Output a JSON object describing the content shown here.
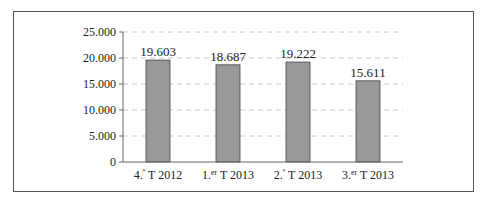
{
  "chart_data": {
    "type": "bar",
    "title": "",
    "xlabel": "",
    "ylabel": "",
    "categories": [
      "4.º T 2012",
      "1.er T 2013",
      "2.º T 2013",
      "3.er T 2013"
    ],
    "category_parts": [
      {
        "num": "4.",
        "sup": "º",
        "rest": " T 2012"
      },
      {
        "num": "1.",
        "sup": "er",
        "rest": " T 2013"
      },
      {
        "num": "2.",
        "sup": "º",
        "rest": " T 2013"
      },
      {
        "num": "3.",
        "sup": "er",
        "rest": " T 2013"
      }
    ],
    "values": [
      19603,
      18687,
      19222,
      15611
    ],
    "value_labels": [
      "19.603",
      "18.687",
      "19.222",
      "15.611"
    ],
    "ylim": [
      0,
      25000
    ],
    "yticks": [
      0,
      5000,
      10000,
      15000,
      20000,
      25000
    ],
    "ytick_labels": [
      "0",
      "5.000",
      "10.000",
      "15.000",
      "20.000",
      "25.000"
    ],
    "grid": true,
    "grid_style": "dashed",
    "legend": false,
    "colors": {
      "bar_fill": "#999999",
      "bar_stroke": "#444444",
      "grid": "#c8c8c8",
      "axis": "#666666"
    }
  }
}
